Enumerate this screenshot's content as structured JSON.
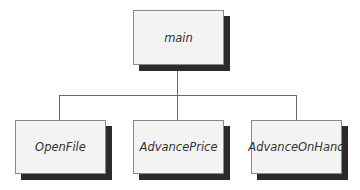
{
  "diagram": {
    "type": "hierarchy-chart",
    "root": {
      "label": "main"
    },
    "children": [
      {
        "label": "OpenFile"
      },
      {
        "label": "AdvancePrice"
      },
      {
        "label": "AdvanceOnHand"
      }
    ]
  }
}
